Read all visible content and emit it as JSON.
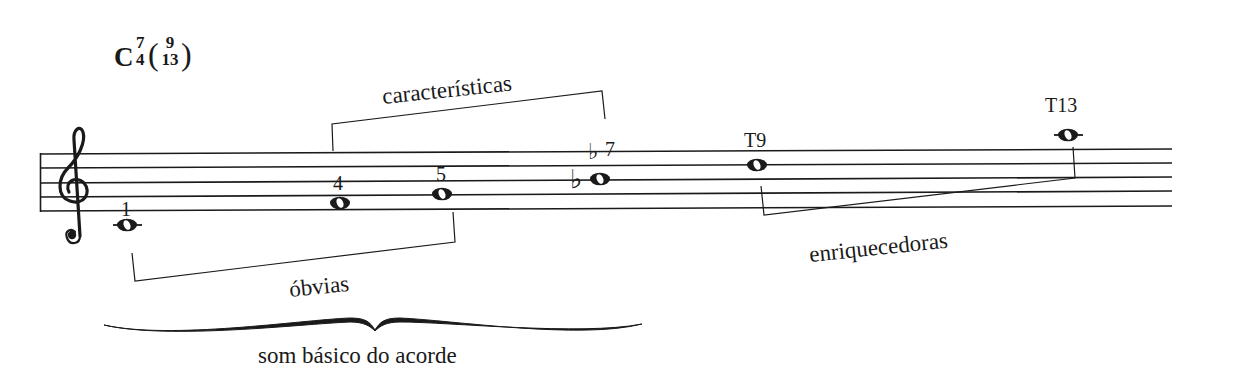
{
  "chord_symbol": {
    "root": "C",
    "ext_top": "7",
    "ext_bottom": "4",
    "paren_open": "(",
    "paren_close": ")",
    "tension_top": "9",
    "tension_bottom": "13"
  },
  "clef": "treble",
  "notes": [
    {
      "label": "1",
      "pitch": "C4"
    },
    {
      "label": "4",
      "pitch": "F4"
    },
    {
      "label": "5",
      "pitch": "G4"
    },
    {
      "label": "♭7",
      "pitch": "B♭4",
      "accidental": "♭"
    },
    {
      "label": "T9",
      "pitch": "D5"
    },
    {
      "label": "T13",
      "pitch": "A5"
    }
  ],
  "labels": {
    "note_1": "1",
    "note_4": "4",
    "note_5": "5",
    "note_b7_flat": "♭",
    "note_b7_num": "7",
    "note_t9": "T9",
    "note_t13": "T13",
    "group_caracteristicas": "características",
    "group_obvias": "óbvias",
    "group_enriquecedoras": "enriquecedoras",
    "group_basico": "som básico do acorde"
  },
  "colors": {
    "ink": "#1a1a1a",
    "background": "#ffffff"
  }
}
